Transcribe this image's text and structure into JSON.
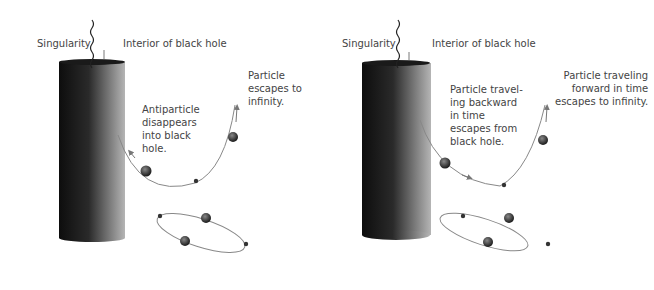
{
  "panels": [
    {
      "id": "left",
      "labels": {
        "singularity": "Singularity",
        "interior": "Interior of black hole",
        "particle": [
          "Particle",
          "escapes to",
          "infinity."
        ],
        "antiparticle": [
          "Antiparticle",
          "disappears",
          "into black",
          "hole."
        ]
      }
    },
    {
      "id": "right",
      "labels": {
        "singularity": "Singularity",
        "interior": "Interior of black hole",
        "particle": [
          "Particle traveling",
          "forward in time",
          "escapes to infinity."
        ],
        "antiparticle": [
          "Particle travel-",
          "ing backward",
          "in time",
          "escapes from",
          "black hole."
        ]
      }
    }
  ],
  "colors": {
    "text": "#444444",
    "line": "#888888",
    "cylinder_dark": "#111111",
    "cylinder_light": "#bbbbbb"
  }
}
